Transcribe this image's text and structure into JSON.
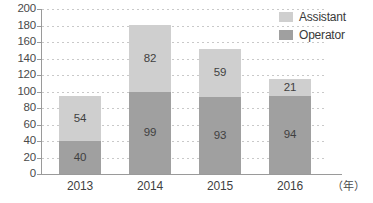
{
  "chart_data": {
    "type": "bar",
    "stacked": true,
    "title": "",
    "subtitle": "",
    "xlabel": "（年）",
    "ylabel": "",
    "categories": [
      "2013",
      "2014",
      "2015",
      "2016"
    ],
    "series": [
      {
        "name": "Operator",
        "values": [
          40,
          99,
          93,
          94
        ],
        "color": "#a0a0a0"
      },
      {
        "name": "Assistant",
        "values": [
          54,
          82,
          59,
          21
        ],
        "color": "#cfcfcf"
      }
    ],
    "totals": [
      94,
      181,
      152,
      115
    ],
    "ylim": [
      0,
      200
    ],
    "ytick_step": 20,
    "yticks": [
      "200",
      "180",
      "160",
      "140",
      "120",
      "100",
      "80",
      "60",
      "40",
      "20",
      "0"
    ],
    "grid": true,
    "grid_style": "dotted-horizontal",
    "legend_position": "top-right"
  },
  "legend": {
    "entries": [
      {
        "label": "Assistant",
        "color": "#cfcfcf"
      },
      {
        "label": "Operator",
        "color": "#a0a0a0"
      }
    ]
  },
  "axes": {
    "x_unit": "（年）",
    "axis_color": "#9a9a9a",
    "grid_color": "#c9c9c9"
  },
  "colors": {
    "assistant": "#cfcfcf",
    "operator": "#a0a0a0",
    "text": "#3a3a3a",
    "background": "#ffffff"
  }
}
